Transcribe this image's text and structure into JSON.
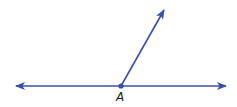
{
  "diagram": {
    "type": "geometry-angle",
    "color": "#3a4fa8",
    "line": {
      "left_tip": [
        16,
        86
      ],
      "right_tip": [
        226,
        86
      ]
    },
    "ray": {
      "origin": [
        121,
        86
      ],
      "tip": [
        164,
        10
      ]
    },
    "vertex": {
      "label": "A",
      "position": [
        121,
        86
      ]
    }
  }
}
